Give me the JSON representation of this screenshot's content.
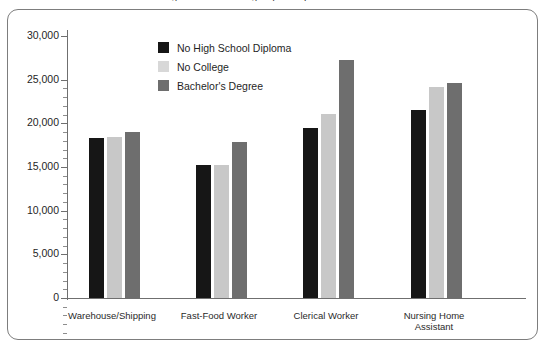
{
  "chart_data": {
    "type": "bar",
    "title": "Average Annual Earnings by Occupation and Education",
    "xlabel": "",
    "ylabel": "",
    "ylim": [
      0,
      30000
    ],
    "ytick_step": 5000,
    "yticks": [
      0,
      5000,
      10000,
      15000,
      20000,
      25000,
      30000
    ],
    "ytick_labels": [
      "0",
      "5,000",
      "10,000",
      "15,000",
      "20,000",
      "25,000",
      "30,000"
    ],
    "minor_ticks_per_interval": 5,
    "grid": false,
    "legend_position": "upper-left-inside",
    "categories": [
      "Warehouse/Shipping",
      "Fast-Food Worker",
      "Clerical Worker",
      "Nursing Home\nAssistant"
    ],
    "category_labels": [
      {
        "line1": "Warehouse/Shipping",
        "line2": ""
      },
      {
        "line1": "Fast-Food Worker",
        "line2": ""
      },
      {
        "line1": "Clerical Worker",
        "line2": ""
      },
      {
        "line1": "Nursing Home",
        "line2": "Assistant"
      }
    ],
    "series": [
      {
        "name": "No High School Diploma",
        "color": "#161616",
        "values": [
          18300,
          15200,
          19500,
          21500
        ]
      },
      {
        "name": "No College",
        "color": "#c8c8c8",
        "values": [
          18400,
          15200,
          21100,
          24200
        ]
      },
      {
        "name": "Bachelor's Degree",
        "color": "#6e6e6e",
        "values": [
          19000,
          17900,
          27200,
          24600
        ]
      }
    ]
  },
  "legend": {
    "items": [
      {
        "label": "No High School Diploma",
        "color": "#161616"
      },
      {
        "label": "No College",
        "color": "#d8d8d8"
      },
      {
        "label": "Bachelor's Degree",
        "color": "#6e6e6e"
      }
    ]
  },
  "axis": {
    "y_labels": [
      {
        "text": "30,000",
        "value": 30000
      },
      {
        "text": "25,000",
        "value": 25000
      },
      {
        "text": "20,000",
        "value": 20000
      },
      {
        "text": "15,000",
        "value": 15000
      },
      {
        "text": "10,000",
        "value": 10000
      },
      {
        "text": "5,000",
        "value": 5000
      },
      {
        "text": "0",
        "value": 0
      }
    ]
  },
  "frame": {
    "border_color": "#7d7d7d",
    "background": "#ffffff"
  }
}
